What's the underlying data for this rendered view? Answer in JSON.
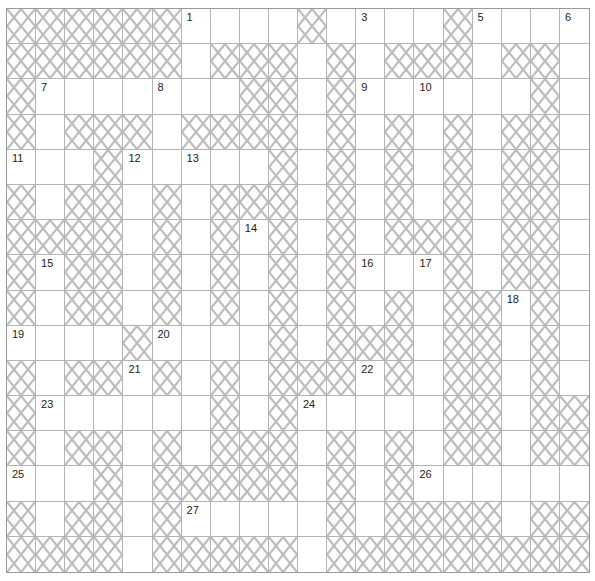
{
  "puzzle": {
    "cols": 20,
    "rows": 16,
    "colors": {
      "grid_line": "#b4b4b4",
      "border": "#9a9a9a",
      "hatch": "#bdbdbd",
      "number": "#222222"
    },
    "layout": [
      "XXXXXX....X....X....",
      "XXXXXX.XXX.X.XXX.XX.",
      "X.......XX.X......X.",
      "X.XXX.XXXX.X.X.X.XX.",
      "...X.....X.X.X.X.XX.",
      "X.XX.X.XXX.X.X.X.XX.",
      "XXXX.X.X.X.X.XXX.XX.",
      "X.XX.X.X.X.X...X.XX.",
      "X.XX.X.X.X.X.X.XX.X.",
      "....X....X.XXX.XX.X.",
      "X.XX.X.X.XXX.X.XX.X.",
      "X......X.X.....XX.XX",
      "X.XX.X.XXX.X.X.XX.XX",
      "...X.XXXXX.X.X......",
      "X.XX.X.....X.XXXX.XX",
      "XXXX.XXXXX.XXXXXXXXX"
    ],
    "numbers": [
      {
        "n": "1",
        "r": 0,
        "c": 6
      },
      {
        "n": "2",
        "r": 0,
        "c": 10
      },
      {
        "n": "3",
        "r": 0,
        "c": 12
      },
      {
        "n": "4",
        "r": 0,
        "c": 15
      },
      {
        "n": "5",
        "r": 0,
        "c": 16
      },
      {
        "n": "6",
        "r": 0,
        "c": 19
      },
      {
        "n": "7",
        "r": 2,
        "c": 1
      },
      {
        "n": "8",
        "r": 2,
        "c": 5
      },
      {
        "n": "9",
        "r": 2,
        "c": 12
      },
      {
        "n": "10",
        "r": 2,
        "c": 14
      },
      {
        "n": "11",
        "r": 4,
        "c": 0
      },
      {
        "n": "12",
        "r": 4,
        "c": 4
      },
      {
        "n": "13",
        "r": 4,
        "c": 6
      },
      {
        "n": "14",
        "r": 6,
        "c": 8
      },
      {
        "n": "15",
        "r": 7,
        "c": 1
      },
      {
        "n": "16",
        "r": 7,
        "c": 12
      },
      {
        "n": "17",
        "r": 7,
        "c": 14
      },
      {
        "n": "18",
        "r": 8,
        "c": 17
      },
      {
        "n": "19",
        "r": 9,
        "c": 0
      },
      {
        "n": "20",
        "r": 9,
        "c": 5
      },
      {
        "n": "21",
        "r": 10,
        "c": 4
      },
      {
        "n": "22",
        "r": 10,
        "c": 12
      },
      {
        "n": "23",
        "r": 11,
        "c": 1
      },
      {
        "n": "24",
        "r": 11,
        "c": 10
      },
      {
        "n": "25",
        "r": 13,
        "c": 0
      },
      {
        "n": "26",
        "r": 13,
        "c": 14
      },
      {
        "n": "27",
        "r": 14,
        "c": 6
      }
    ]
  }
}
